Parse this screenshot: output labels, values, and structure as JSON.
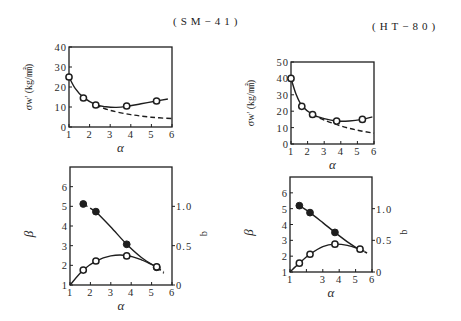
{
  "chart_data": [
    {
      "id": "sm41-stress",
      "type": "line",
      "title": "(SM−41)",
      "xlabel": "α",
      "ylabel": "σw' (kg/㎟)",
      "xlim": [
        1,
        6
      ],
      "ylim": [
        0,
        40
      ],
      "grid": false,
      "xticks": [
        1,
        2,
        3,
        4,
        5,
        6
      ],
      "xticklabels": [
        "1",
        "2",
        "3",
        "4",
        "5",
        "6"
      ],
      "yticks": [
        0,
        10,
        20,
        30,
        40
      ],
      "yticklabels": [
        "0",
        "10",
        "20",
        "30",
        "40"
      ],
      "series": [
        {
          "name": "σw' measured",
          "axis": "y",
          "marker": "open",
          "x": [
            1,
            1.7,
            2.3,
            3.8,
            5.25
          ],
          "y": [
            25,
            14.5,
            11,
            10.5,
            13
          ],
          "solid": [
            [
              [
                1,
                25
              ],
              [
                1.3,
                19.3
              ],
              [
                1.7,
                14.8
              ],
              [
                2.3,
                11.2
              ],
              [
                2.8,
                10.1
              ],
              [
                3.3,
                9.8
              ],
              [
                3.8,
                10.3
              ],
              [
                4.5,
                11.6
              ],
              [
                5.25,
                13
              ],
              [
                5.8,
                14
              ]
            ]
          ],
          "dashed": [
            [
              [
                2.3,
                11
              ],
              [
                3,
                8.3
              ],
              [
                4,
                6.2
              ],
              [
                5,
                4.9
              ],
              [
                6,
                4.2
              ]
            ]
          ]
        }
      ]
    },
    {
      "id": "ht80-stress",
      "type": "line",
      "title": "(HT−80)",
      "xlabel": "α",
      "ylabel": "σw' (kg/㎟)",
      "xlim": [
        1,
        6
      ],
      "ylim": [
        0,
        50
      ],
      "grid": false,
      "xticks": [
        1,
        2,
        3,
        4,
        5,
        6
      ],
      "xticklabels": [
        "1",
        "2",
        "3",
        "4",
        "5",
        "6"
      ],
      "yticks": [
        0,
        10,
        20,
        30,
        40,
        50
      ],
      "yticklabels": [
        "0",
        "10",
        "20",
        "30",
        "40",
        "50"
      ],
      "series": [
        {
          "name": "σw' measured",
          "axis": "y",
          "marker": "open",
          "x": [
            1,
            1.65,
            2.3,
            3.75,
            5.3
          ],
          "y": [
            40,
            23,
            18,
            14,
            15
          ],
          "solid": [
            [
              [
                1,
                40
              ],
              [
                1.3,
                30.5
              ],
              [
                1.65,
                23.5
              ],
              [
                2.3,
                18
              ],
              [
                3,
                15.5
              ],
              [
                3.75,
                14
              ],
              [
                4.5,
                14
              ],
              [
                5.3,
                15
              ],
              [
                5.9,
                16.5
              ]
            ]
          ],
          "dashed": [
            [
              [
                2.3,
                18
              ],
              [
                3,
                14.6
              ],
              [
                4,
                11
              ],
              [
                5,
                8.4
              ],
              [
                6,
                6.6
              ]
            ]
          ]
        }
      ]
    },
    {
      "id": "sm41-beta-q",
      "type": "line",
      "xlabel": "α",
      "ylabel": "β",
      "y2label": "q",
      "xlim": [
        1,
        6
      ],
      "ylim": [
        1,
        7
      ],
      "y2lim": [
        0,
        1.5
      ],
      "grid": false,
      "xticks": [
        1,
        2,
        3,
        4,
        5,
        6
      ],
      "xticklabels": [
        "1",
        "2",
        "3",
        "4",
        "5",
        "6"
      ],
      "yticks": [
        1,
        2,
        3,
        4,
        5,
        6
      ],
      "yticklabels": [
        "1",
        "2",
        "3",
        "4",
        "5",
        "6"
      ],
      "y2ticks": [
        0,
        0.5,
        1.0
      ],
      "y2ticklabels": [
        "0",
        "0.5",
        "1.0"
      ],
      "series": [
        {
          "name": "β",
          "axis": "y",
          "marker": "filled",
          "x": [
            1.65,
            2.27,
            3.78,
            5.25
          ],
          "y": [
            5.12,
            4.73,
            3.07,
            1.9
          ],
          "solid": [
            [
              [
                2.27,
                4.73
              ],
              [
                3,
                3.95
              ],
              [
                3.78,
                3.07
              ],
              [
                4.5,
                2.4
              ],
              [
                5.25,
                1.9
              ]
            ]
          ],
          "dashed": [
            [
              [
                1.65,
                5.12
              ],
              [
                2.27,
                4.73
              ]
            ],
            [
              [
                5.25,
                1.9
              ],
              [
                5.6,
                1.6
              ]
            ]
          ]
        },
        {
          "name": "q",
          "axis": "y2",
          "marker": "open",
          "x": [
            1.65,
            2.27,
            3.78,
            5.25
          ],
          "y": [
            0.19,
            0.305,
            0.37,
            0.23
          ],
          "solid": [
            [
              [
                1,
                0
              ],
              [
                1.65,
                0.19
              ],
              [
                2.27,
                0.305
              ],
              [
                3,
                0.37
              ],
              [
                3.78,
                0.375
              ],
              [
                4.5,
                0.32
              ],
              [
                5.25,
                0.23
              ]
            ]
          ],
          "dashed": [
            [
              [
                5.25,
                0.23
              ],
              [
                5.6,
                0.17
              ]
            ]
          ]
        }
      ]
    },
    {
      "id": "ht80-beta-q",
      "type": "line",
      "xlabel": "α",
      "ylabel": "β",
      "y2label": "q",
      "xlim": [
        1,
        6
      ],
      "ylim": [
        1,
        7
      ],
      "y2lim": [
        0,
        1.5
      ],
      "grid": false,
      "xticks": [
        1,
        2,
        3,
        4,
        5,
        6
      ],
      "xticklabels": [
        "1",
        "",
        "3",
        "4",
        "5",
        "6"
      ],
      "yticks": [
        1,
        2,
        3,
        4,
        5,
        6
      ],
      "yticklabels": [
        "1",
        "2",
        "3",
        "4",
        "5",
        "6"
      ],
      "y2ticks": [
        0,
        0.5,
        1.0
      ],
      "y2ticklabels": [
        "0",
        "0.5",
        "1.0"
      ],
      "series": [
        {
          "name": "β",
          "axis": "y",
          "marker": "filled",
          "x": [
            1.57,
            2.22,
            3.74
          ],
          "y": [
            5.19,
            4.75,
            3.5
          ],
          "solid": [
            [
              [
                1.57,
                5.19
              ],
              [
                2.22,
                4.75
              ],
              [
                3,
                4.12
              ],
              [
                3.74,
                3.5
              ],
              [
                4.5,
                2.9
              ],
              [
                5.1,
                2.5
              ]
            ]
          ],
          "dashed": [
            [
              [
                5.1,
                2.5
              ],
              [
                5.7,
                2.2
              ]
            ]
          ]
        },
        {
          "name": "q",
          "axis": "y2",
          "marker": "open",
          "x": [
            1.57,
            2.22,
            3.74,
            5.27
          ],
          "y": [
            0.14,
            0.28,
            0.44,
            0.36
          ],
          "solid": [
            [
              [
                1,
                0
              ],
              [
                1.57,
                0.14
              ],
              [
                2.22,
                0.28
              ],
              [
                3,
                0.4
              ],
              [
                3.74,
                0.44
              ],
              [
                4.5,
                0.42
              ],
              [
                5.27,
                0.36
              ]
            ]
          ],
          "dashed": [
            [
              [
                5.27,
                0.36
              ],
              [
                5.65,
                0.31
              ]
            ]
          ]
        }
      ]
    }
  ]
}
